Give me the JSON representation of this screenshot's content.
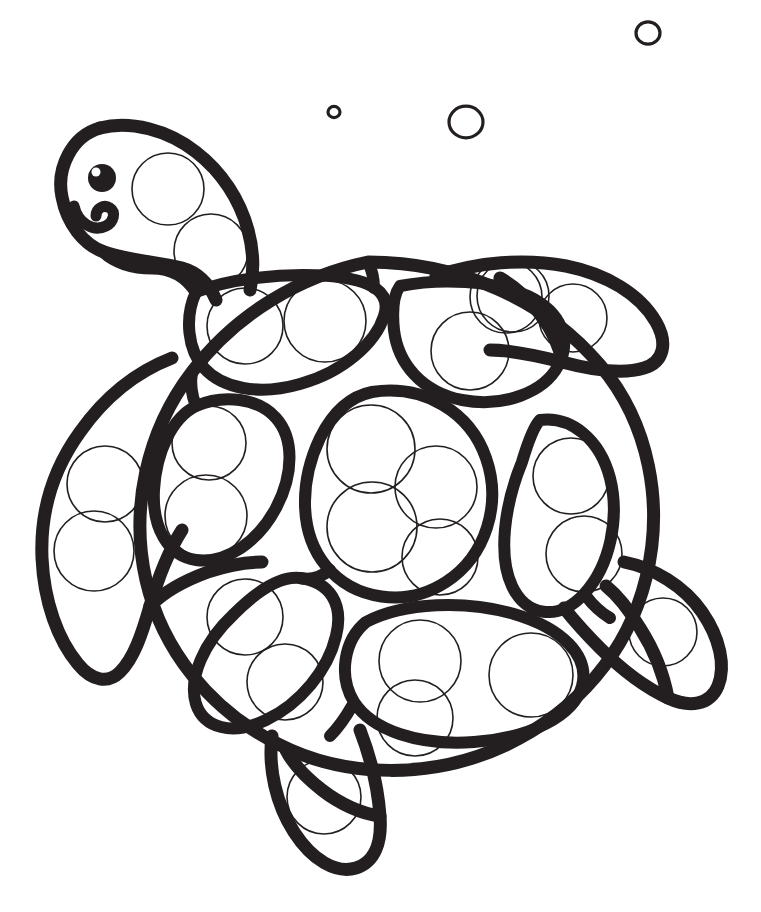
{
  "page": {
    "background_color": "#ffffff",
    "ink_color": "#231f20",
    "width": 761,
    "height": 912,
    "kind": "line-art coloring page"
  },
  "subject": {
    "name": "sea-turtle",
    "orientation": "facing upper-left, top-down view",
    "description": "Cartoon sea turtle outlined in thick black line art with circular dot-marker guide circles filling each body region."
  },
  "head": {
    "eye": {
      "cx": 102,
      "cy": 178,
      "r": 14,
      "fill": "#231f20"
    },
    "eye_highlight": {
      "cx": 96,
      "cy": 172,
      "r": 4.5,
      "fill": "#ffffff"
    },
    "mouth_label": "smile-curve",
    "dot_circles": [
      {
        "cx": 168,
        "cy": 189,
        "r": 36
      },
      {
        "cx": 211,
        "cy": 251,
        "r": 37
      }
    ]
  },
  "shell_segments": [
    {
      "name": "upper-left-plate",
      "dot_circles": [
        {
          "cx": 245,
          "cy": 326,
          "r": 38
        },
        {
          "cx": 325,
          "cy": 321,
          "r": 41
        }
      ]
    },
    {
      "name": "upper-right-plate",
      "dot_circles": [
        {
          "cx": 470,
          "cy": 351,
          "r": 39
        },
        {
          "cx": 513,
          "cy": 296,
          "r": 36
        }
      ]
    },
    {
      "name": "center-plate",
      "dot_circles": [
        {
          "cx": 371,
          "cy": 449,
          "r": 44
        },
        {
          "cx": 436,
          "cy": 487,
          "r": 41
        },
        {
          "cx": 372,
          "cy": 527,
          "r": 45
        },
        {
          "cx": 440,
          "cy": 557,
          "r": 38
        }
      ]
    },
    {
      "name": "left-plate",
      "dot_circles": [
        {
          "cx": 209,
          "cy": 443,
          "r": 37
        },
        {
          "cx": 206,
          "cy": 516,
          "r": 41
        }
      ]
    },
    {
      "name": "right-plate",
      "dot_circles": [
        {
          "cx": 571,
          "cy": 476,
          "r": 38
        },
        {
          "cx": 584,
          "cy": 554,
          "r": 38
        }
      ]
    },
    {
      "name": "lower-left-plate",
      "dot_circles": [
        {
          "cx": 245,
          "cy": 617,
          "r": 38
        },
        {
          "cx": 285,
          "cy": 682,
          "r": 38
        }
      ]
    },
    {
      "name": "lower-right-plate",
      "dot_circles": [
        {
          "cx": 420,
          "cy": 661,
          "r": 41
        },
        {
          "cx": 531,
          "cy": 675,
          "r": 42
        },
        {
          "cx": 415,
          "cy": 718,
          "r": 38
        }
      ]
    }
  ],
  "flippers": [
    {
      "name": "front-left-flipper",
      "dot_circles": [
        {
          "cx": 105,
          "cy": 484,
          "r": 38
        },
        {
          "cx": 94,
          "cy": 551,
          "r": 40
        }
      ]
    },
    {
      "name": "front-right-flipper",
      "dot_circles": [
        {
          "cx": 506,
          "cy": 297,
          "r": 36
        },
        {
          "cx": 573,
          "cy": 318,
          "r": 34
        }
      ]
    },
    {
      "name": "rear-right-flipper",
      "dot_circles": [
        {
          "cx": 663,
          "cy": 632,
          "r": 34
        }
      ]
    },
    {
      "name": "rear-bottom-flipper",
      "dot_circles": [
        {
          "cx": 324,
          "cy": 797,
          "r": 37
        }
      ]
    }
  ],
  "bubbles": [
    {
      "name": "bubble-small",
      "cx": 334,
      "cy": 112,
      "r": 6
    },
    {
      "name": "bubble-medium",
      "cx": 466,
      "cy": 122,
      "r": 17
    },
    {
      "name": "bubble-large",
      "cx": 648,
      "cy": 33,
      "r": 12
    }
  ]
}
